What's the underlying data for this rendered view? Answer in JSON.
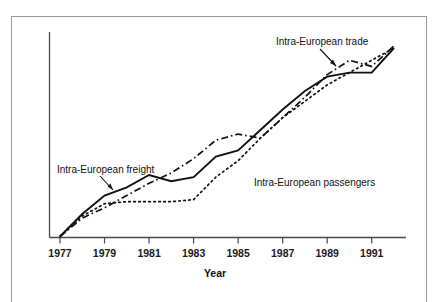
{
  "figure": {
    "frame_color": "#9a9a9a",
    "background": "#ffffff",
    "bleed_top_text": "",
    "bleed_bottom_text": ""
  },
  "axis": {
    "x_title": "Year",
    "tick_labels": [
      "1977",
      "1979",
      "1981",
      "1983",
      "1985",
      "1987",
      "1989",
      "1991"
    ]
  },
  "annotations": {
    "freight_label": "Intra-European freight",
    "trade_label": "Intra-European trade",
    "passengers_label": "Intra-European passengers"
  },
  "chart_data": {
    "type": "line",
    "title": "",
    "subtitle": "",
    "xlabel": "Year",
    "ylabel": "",
    "grid": false,
    "legend_position": "inline-annotations",
    "x": [
      1977,
      1978,
      1979,
      1980,
      1981,
      1982,
      1983,
      1984,
      1985,
      1986,
      1987,
      1988,
      1989,
      1990,
      1991,
      1992
    ],
    "xlim": [
      1977,
      1992
    ],
    "ylim": [
      0,
      100
    ],
    "x_tick_values": [
      1977,
      1979,
      1981,
      1983,
      1985,
      1987,
      1989,
      1991
    ],
    "x_tick_labels": [
      "1977",
      "1979",
      "1981",
      "1983",
      "1985",
      "1987",
      "1989",
      "1991"
    ],
    "series": [
      {
        "name": "Intra-European freight",
        "style": "solid",
        "color": "#111111",
        "values": [
          0,
          11,
          20,
          24,
          30,
          27,
          29,
          39,
          42,
          52,
          62,
          71,
          78,
          80,
          80,
          92
        ]
      },
      {
        "name": "Intra-European trade",
        "style": "dash-dot",
        "color": "#111111",
        "values": [
          0,
          9,
          14,
          20,
          26,
          31,
          38,
          47,
          50,
          48,
          58,
          68,
          79,
          86,
          83,
          93
        ]
      },
      {
        "name": "Intra-European passengers",
        "style": "dotted",
        "color": "#111111",
        "values": [
          0,
          10,
          16,
          17,
          17,
          17,
          18,
          29,
          37,
          48,
          58,
          66,
          74,
          80,
          86,
          92
        ]
      }
    ]
  }
}
